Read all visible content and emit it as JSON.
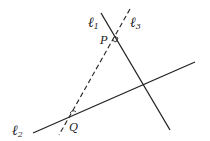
{
  "diagram": {
    "lines": [
      {
        "id": "l1",
        "label": "ℓ",
        "subscript": "1",
        "style": "solid"
      },
      {
        "id": "l2",
        "label": "ℓ",
        "subscript": "2",
        "style": "solid"
      },
      {
        "id": "l3",
        "label": "ℓ",
        "subscript": "3",
        "style": "dashed"
      }
    ],
    "points": [
      {
        "id": "P",
        "label": "P",
        "mark": "right-angle"
      },
      {
        "id": "Q",
        "label": "Q",
        "mark": "angle-arc"
      }
    ],
    "colors": {
      "stroke": "#222222",
      "background": "#ffffff"
    }
  }
}
